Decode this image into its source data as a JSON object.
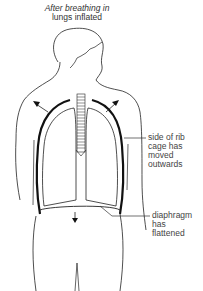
{
  "title": {
    "line1": "After breathing in",
    "line2": "lungs inflated"
  },
  "labels": {
    "rib_cage": [
      "side of rib",
      "cage has",
      "moved",
      "outwards"
    ],
    "diaphragm": [
      "diaphragm",
      "has",
      "flattened"
    ]
  },
  "icons": {
    "rib_arrows": "arrow-up-outward-icon",
    "diaphragm_arrow": "arrow-down-icon"
  },
  "colors": {
    "line": "#222222",
    "text": "#444444",
    "background": "#ffffff"
  }
}
